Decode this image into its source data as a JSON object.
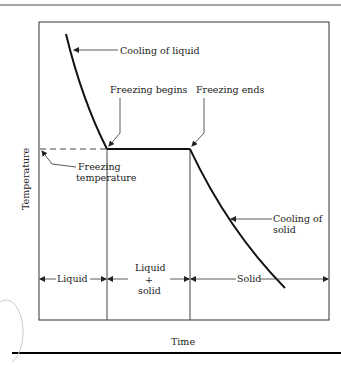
{
  "figure": {
    "axes": {
      "xlabel": "Time",
      "ylabel": "Temperature"
    },
    "annotations": {
      "cooling_liquid": "Cooling of liquid",
      "freezing_begins": "Freezing begins",
      "freezing_ends": "Freezing ends",
      "freezing_temp_line1": "Freezing",
      "freezing_temp_line2": "temperature",
      "cooling_solid_line1": "Cooling of",
      "cooling_solid_line2": "solid"
    },
    "phases": {
      "liquid": "Liquid",
      "mixed_line1": "Liquid",
      "mixed_line2": "+",
      "mixed_line3": "solid",
      "solid": "Solid"
    },
    "colors": {
      "curve": "#111111",
      "frame": "#333333",
      "guide": "#555555",
      "text": "#222222",
      "top_rule": "#888888",
      "bottom_rule": "#000000"
    }
  }
}
